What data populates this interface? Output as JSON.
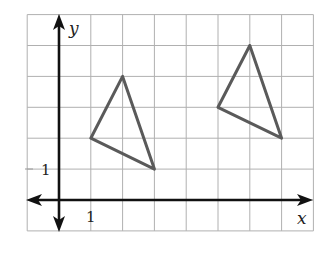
{
  "figure": {
    "axes": {
      "x_label": "x",
      "y_label": "y",
      "x_tick_label": "1",
      "y_tick_label": "1"
    },
    "grid": {
      "x_min": -1,
      "x_max": 8,
      "y_min": -1,
      "y_max": 6,
      "origin_px": [
        59,
        200
      ],
      "unit_px": [
        31.8,
        30.9
      ],
      "line_color": "#b0b0b0"
    },
    "shapes": [
      {
        "name": "triangle-original",
        "vertices": [
          [
            2,
            4
          ],
          [
            1,
            2
          ],
          [
            3,
            1
          ]
        ],
        "stroke": "#5a5a5a"
      },
      {
        "name": "triangle-image",
        "vertices": [
          [
            6,
            5
          ],
          [
            5,
            3
          ],
          [
            7,
            2
          ]
        ],
        "stroke": "#5a5a5a"
      }
    ],
    "translation": [
      4,
      1
    ]
  }
}
